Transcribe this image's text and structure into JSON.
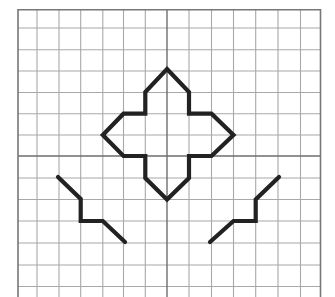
{
  "grid": {
    "x_lines": [
      18,
      37,
      59,
      80.7,
      102.8,
      123.5,
      145.3,
      167,
      189,
      211.5,
      233.5,
      255.7,
      278,
      300.5,
      320.5
    ],
    "y_lines": [
      9.7,
      28,
      49.7,
      71,
      92.5,
      113.7,
      135,
      156,
      178,
      199.5,
      221,
      243,
      265,
      286.5
    ],
    "center_x": 167,
    "center_y": 156,
    "bottom": 297,
    "colors": {
      "grid": "#a8a8a8",
      "axis": "#6e6e6e",
      "border": "#777777",
      "shape": "#222222"
    }
  },
  "shapes": [
    {
      "name": "four-point-star",
      "closed": true,
      "points": [
        [
          167,
          69
        ],
        [
          189,
          92
        ],
        [
          189,
          113.7
        ],
        [
          211.5,
          113.7
        ],
        [
          233.5,
          135
        ],
        [
          211.5,
          156
        ],
        [
          189,
          156
        ],
        [
          189,
          178
        ],
        [
          167,
          199.5
        ],
        [
          145.3,
          178
        ],
        [
          145.3,
          156
        ],
        [
          123.5,
          156
        ],
        [
          102.8,
          135
        ],
        [
          123.5,
          113.7
        ],
        [
          145.3,
          113.7
        ],
        [
          145.3,
          92
        ]
      ]
    },
    {
      "name": "left-zigzag",
      "closed": false,
      "points": [
        [
          58,
          177
        ],
        [
          80.7,
          199
        ],
        [
          80.7,
          221
        ],
        [
          102.8,
          221
        ],
        [
          125,
          242
        ]
      ]
    },
    {
      "name": "right-zigzag",
      "closed": false,
      "points": [
        [
          210,
          242
        ],
        [
          233.5,
          221
        ],
        [
          255.7,
          221
        ],
        [
          255.7,
          199.5
        ],
        [
          279,
          177
        ]
      ]
    }
  ]
}
